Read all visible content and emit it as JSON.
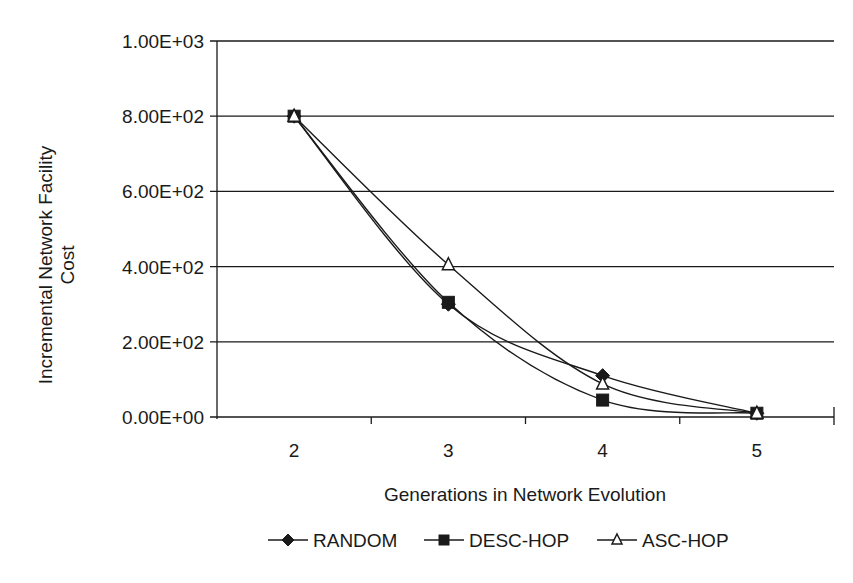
{
  "chart_data": {
    "type": "line",
    "title": "",
    "xlabel": "Generations in Network Evolution",
    "ylabel": "Incremental Network Facility Cost",
    "ylabel_lines": [
      "Incremental Network Facility",
      "Cost"
    ],
    "categories": [
      "2",
      "3",
      "4",
      "5"
    ],
    "y_ticks": [
      "0.00E+00",
      "2.00E+02",
      "4.00E+02",
      "6.00E+02",
      "8.00E+02",
      "1.00E+03"
    ],
    "ylim": [
      0,
      1000
    ],
    "grid": "horizontal",
    "smoothed": true,
    "legend_position": "bottom",
    "series": [
      {
        "name": "RANDOM",
        "marker": "diamond-filled",
        "values": [
          800,
          300,
          110,
          10
        ]
      },
      {
        "name": "DESC-HOP",
        "marker": "square-filled",
        "values": [
          800,
          305,
          45,
          10
        ]
      },
      {
        "name": "ASC-HOP",
        "marker": "triangle-open",
        "values": [
          800,
          405,
          88,
          10
        ]
      }
    ]
  },
  "colors": {
    "line": "#1a1a1a",
    "grid": "#1a1a1a",
    "background": "#ffffff"
  }
}
